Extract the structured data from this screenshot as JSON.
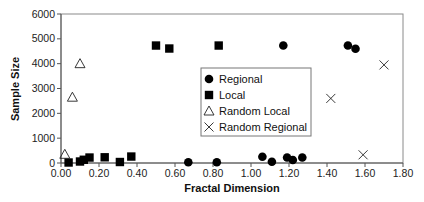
{
  "chart_data": {
    "type": "scatter",
    "title": "",
    "xlabel": "Fractal Dimension",
    "ylabel": "Sample Size",
    "xlim": [
      0,
      1.8
    ],
    "ylim": [
      0,
      6000
    ],
    "x_ticks": [
      "0.00",
      "0.20",
      "0.40",
      "0.60",
      "0.80",
      "1.00",
      "1.20",
      "1.40",
      "1.60",
      "1.80"
    ],
    "y_ticks": [
      "0",
      "1000",
      "2000",
      "3000",
      "4000",
      "5000",
      "6000"
    ],
    "grid": false,
    "legend_position": "inside-center",
    "series": [
      {
        "name": "Regional",
        "marker": "circle-filled",
        "points": [
          [
            0.67,
            30
          ],
          [
            0.82,
            30
          ],
          [
            1.06,
            250
          ],
          [
            1.11,
            50
          ],
          [
            1.19,
            220
          ],
          [
            1.22,
            120
          ],
          [
            1.27,
            220
          ],
          [
            1.17,
            4730
          ],
          [
            1.51,
            4730
          ],
          [
            1.55,
            4600
          ]
        ]
      },
      {
        "name": "Local",
        "marker": "square-filled",
        "points": [
          [
            0.04,
            20
          ],
          [
            0.1,
            60
          ],
          [
            0.12,
            130
          ],
          [
            0.15,
            220
          ],
          [
            0.23,
            230
          ],
          [
            0.31,
            40
          ],
          [
            0.37,
            260
          ],
          [
            0.5,
            4730
          ],
          [
            0.57,
            4610
          ],
          [
            0.83,
            4730
          ]
        ]
      },
      {
        "name": "Random Local",
        "marker": "triangle-open",
        "points": [
          [
            0.02,
            350
          ],
          [
            0.06,
            2650
          ],
          [
            0.1,
            4000
          ]
        ]
      },
      {
        "name": "Random Regional",
        "marker": "x-cross",
        "points": [
          [
            1.42,
            2600
          ],
          [
            1.59,
            330
          ],
          [
            1.7,
            3950
          ]
        ]
      }
    ]
  },
  "legend": {
    "items": [
      {
        "label": "Regional",
        "icon": "circle-filled-icon"
      },
      {
        "label": "Local",
        "icon": "square-filled-icon"
      },
      {
        "label": "Random Local",
        "icon": "triangle-open-icon"
      },
      {
        "label": "Random Regional",
        "icon": "x-cross-icon"
      }
    ]
  },
  "colors": {
    "marker": "#000000",
    "axis": "#555555",
    "frame": "#888888",
    "background": "#ffffff"
  }
}
